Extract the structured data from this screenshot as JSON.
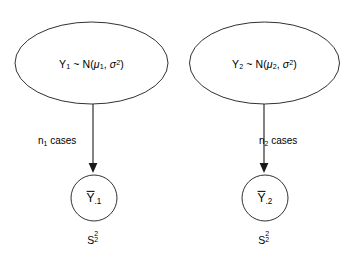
{
  "diagram": {
    "colors": {
      "stroke": "#1a1a1a",
      "background": "#ffffff",
      "text": "#000000"
    },
    "groups": [
      {
        "id": "group-1",
        "population": {
          "variable": "Y",
          "variable_subscript": "1",
          "relation": "~",
          "distribution": "N",
          "mean_symbol": "μ",
          "mean_subscript": "1",
          "variance_symbol": "σ",
          "variance_exponent": "2",
          "plain_text": "Y1 ~ N(μ1, σ2)"
        },
        "edge": {
          "symbol": "n",
          "subscript": "1",
          "word": "cases",
          "plain_text": "n1 cases"
        },
        "sample_mean": {
          "symbol": "Y",
          "subscript": ".1",
          "has_overbar": true,
          "plain_text": "Ybar.1"
        },
        "sample_variance": {
          "symbol": "S",
          "subscript": "2",
          "superscript": "2",
          "plain_text": "S2^2"
        }
      },
      {
        "id": "group-2",
        "population": {
          "variable": "Y",
          "variable_subscript": "2",
          "relation": "~",
          "distribution": "N",
          "mean_symbol": "μ",
          "mean_subscript": "2",
          "variance_symbol": "σ",
          "variance_exponent": "2",
          "plain_text": "Y2 ~ N(μ2, σ2)"
        },
        "edge": {
          "symbol": "n",
          "subscript": "2",
          "word": "cases",
          "plain_text": "n2 cases"
        },
        "sample_mean": {
          "symbol": "Y",
          "subscript": ".2",
          "has_overbar": true,
          "plain_text": "Ybar.2"
        },
        "sample_variance": {
          "symbol": "S",
          "subscript": "2",
          "superscript": "2",
          "plain_text": "S2^2"
        }
      }
    ]
  }
}
